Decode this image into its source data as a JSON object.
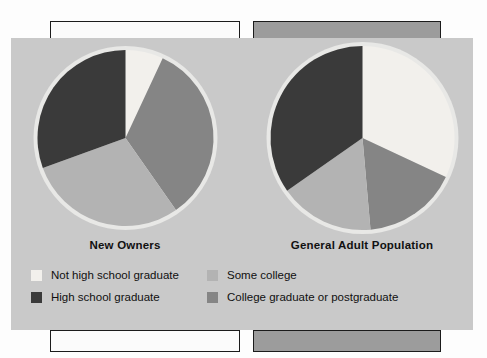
{
  "figure": {
    "background_color": "#c9c9c9",
    "panel_white_color": "#fbfbfb",
    "panel_gray_color": "#9c9c9c"
  },
  "legend": {
    "columns": [
      [
        {
          "label": "Not high school graduate",
          "color": "#f2f0ec"
        },
        {
          "label": "High school graduate",
          "color": "#3a3a3a"
        }
      ],
      [
        {
          "label": "Some college",
          "color": "#b3b3b3"
        },
        {
          "label": "College graduate or postgraduate",
          "color": "#858585"
        }
      ]
    ]
  },
  "chart_data": {
    "type": "pie",
    "title": "",
    "legend_position": "bottom",
    "categories": [
      "Not high school graduate",
      "College graduate or postgraduate",
      "Some college",
      "High school graduate"
    ],
    "colors": [
      "#f2f0ec",
      "#858585",
      "#b3b3b3",
      "#3a3a3a"
    ],
    "charts": [
      {
        "title": "New Owners",
        "center_x": 118,
        "center_y": 143,
        "radius": 88,
        "slices": [
          {
            "label": "Not high school graduate",
            "value": 7,
            "start_deg": 0,
            "end_deg": 25,
            "color": "#f2f0ec"
          },
          {
            "label": "College graduate or postgraduate",
            "value": 33,
            "start_deg": 25,
            "end_deg": 145,
            "color": "#858585"
          },
          {
            "label": "Some college",
            "value": 29,
            "start_deg": 145,
            "end_deg": 250,
            "color": "#b3b3b3"
          },
          {
            "label": "High school graduate",
            "value": 31,
            "start_deg": 250,
            "end_deg": 360,
            "color": "#3a3a3a"
          }
        ]
      },
      {
        "title": "General Adult Population",
        "center_x": 368,
        "center_y": 150,
        "radius": 92,
        "slices": [
          {
            "label": "Not high school graduate",
            "value": 32,
            "start_deg": 0,
            "end_deg": 115,
            "color": "#f2f0ec"
          },
          {
            "label": "College graduate or postgraduate",
            "value": 17,
            "start_deg": 115,
            "end_deg": 175,
            "color": "#858585"
          },
          {
            "label": "Some college",
            "value": 17,
            "start_deg": 175,
            "end_deg": 235,
            "color": "#b3b3b3"
          },
          {
            "label": "High school graduate",
            "value": 34,
            "start_deg": 235,
            "end_deg": 360,
            "color": "#3a3a3a"
          }
        ]
      }
    ]
  }
}
